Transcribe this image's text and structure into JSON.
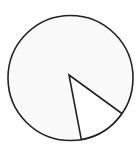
{
  "chart_data": {
    "type": "pie",
    "title": "",
    "categories": [
      "Large sector",
      "Small sector"
    ],
    "values": [
      87.5,
      12.5
    ],
    "start_angle_deg": 34.6,
    "end_angle_deg": 80.0,
    "legend": "none",
    "labels_shown": false
  },
  "colors": {
    "large_sector_fill": "#f9f9f9",
    "small_sector_fill": "#ffffff",
    "outline": "#222222",
    "background": "#ffffff"
  }
}
